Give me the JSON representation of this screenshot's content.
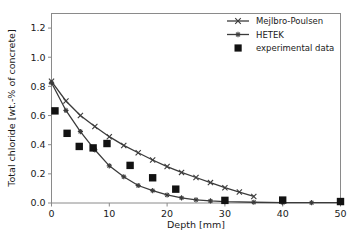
{
  "chart_data": {
    "type": "line",
    "title": "",
    "xlabel": "Depth [mm]",
    "ylabel": "Total chloride [wt.-% of concrete]",
    "xlim": [
      0,
      50
    ],
    "ylim": [
      0.0,
      1.3
    ],
    "xticks": [
      0,
      10,
      20,
      30,
      40,
      50
    ],
    "xtick_labels": [
      "0",
      "10",
      "20",
      "30",
      "40",
      "50"
    ],
    "yticks": [
      0.0,
      0.2,
      0.4,
      0.6,
      0.8,
      1.0,
      1.2
    ],
    "ytick_labels": [
      "0.0",
      "0.2",
      "0.4",
      "0.6",
      "0.8",
      "1.0",
      "1.2"
    ],
    "grid": false,
    "legend_position": "top-right",
    "series": [
      {
        "name": "Mejlbro-Poulsen",
        "marker": "x",
        "color": "#3b3b3b",
        "x": [
          0,
          2.5,
          5,
          7.5,
          10,
          12.5,
          15,
          17.5,
          20,
          22.5,
          25,
          27.5,
          30,
          32.5,
          35
        ],
        "y": [
          0.835,
          0.7,
          0.6,
          0.525,
          0.455,
          0.395,
          0.345,
          0.295,
          0.25,
          0.21,
          0.175,
          0.14,
          0.105,
          0.075,
          0.045
        ]
      },
      {
        "name": "HETEK",
        "marker": "star",
        "color": "#3b3b3b",
        "x": [
          0,
          2.5,
          5,
          7.5,
          10,
          12.5,
          15,
          17.5,
          20,
          22.5,
          25,
          27.5,
          30,
          35,
          40,
          45,
          50
        ],
        "y": [
          0.825,
          0.635,
          0.49,
          0.365,
          0.255,
          0.18,
          0.12,
          0.085,
          0.055,
          0.035,
          0.022,
          0.014,
          0.009,
          0.005,
          0.003,
          0.002,
          0.002
        ]
      },
      {
        "name": "experimental data",
        "marker": "square",
        "color": "#121212",
        "x": [
          0.6,
          2.7,
          4.8,
          7.2,
          9.6,
          13.6,
          17.5,
          21.5,
          30.0,
          40.0,
          50.0
        ],
        "y": [
          0.632,
          0.478,
          0.388,
          0.378,
          0.408,
          0.258,
          0.173,
          0.095,
          0.018,
          0.02,
          0.01
        ]
      }
    ]
  },
  "legend": {
    "entries": [
      {
        "label": "Mejlbro-Poulsen",
        "marker": "x-line-marker"
      },
      {
        "label": "HETEK",
        "marker": "star-line-marker"
      },
      {
        "label": "experimental data",
        "marker": "filled-square-marker"
      }
    ]
  },
  "axes": {
    "x_title": "Depth [mm]",
    "y_title": "Total chloride [wt.-% of concrete]"
  }
}
